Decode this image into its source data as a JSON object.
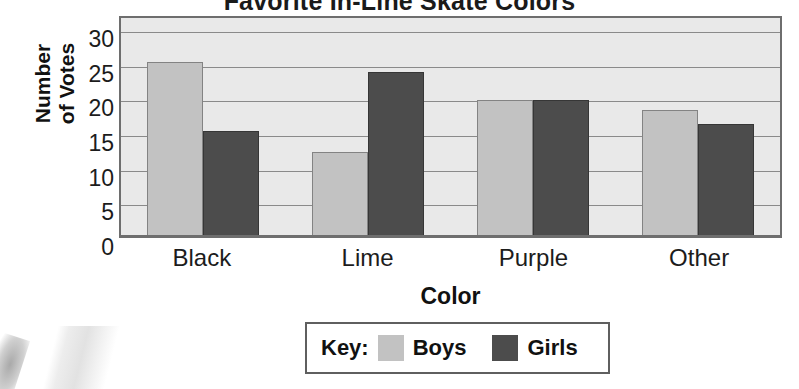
{
  "chart_data": {
    "type": "bar",
    "title": "Favorite In-Line Skate Colors",
    "xlabel": "Color",
    "ylabel": "Number of Votes",
    "ylabel_lines": [
      "Number",
      "of Votes"
    ],
    "categories": [
      "Black",
      "Lime",
      "Purple",
      "Other"
    ],
    "series": [
      {
        "name": "Boys",
        "values": [
          25,
          12,
          19.5,
          18
        ],
        "color": "#c2c2c2"
      },
      {
        "name": "Girls",
        "values": [
          15,
          23.5,
          19.5,
          16
        ],
        "color": "#4c4c4c"
      }
    ],
    "ylim": [
      0,
      32
    ],
    "yticks": [
      0,
      5,
      10,
      15,
      20,
      25,
      30
    ],
    "ytick_labels": [
      "0",
      "5",
      "10",
      "15",
      "20",
      "25",
      "30"
    ],
    "grid": true,
    "grid_axis": "y",
    "legend": {
      "title": "Key:",
      "position": "bottom",
      "entries": [
        {
          "label": "Boys",
          "color": "#c2c2c2"
        },
        {
          "label": "Girls",
          "color": "#4c4c4c"
        }
      ]
    },
    "plot_background": "#e9e9e9",
    "axis_color": "#6e6e6e"
  }
}
